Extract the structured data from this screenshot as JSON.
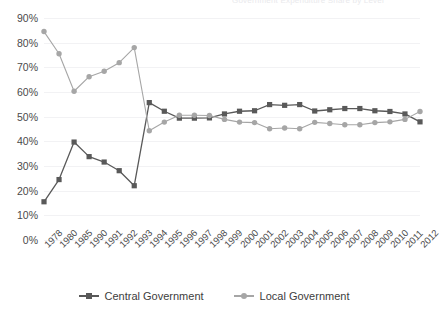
{
  "cropped_title": {
    "text": "Government Expenditure Share by Level"
  },
  "legend": {
    "position": "bottom-center",
    "items": [
      {
        "label": "Central Government",
        "color": "#595959",
        "marker": "square"
      },
      {
        "label": "Local Government",
        "color": "#a6a6a6",
        "marker": "circle"
      }
    ]
  },
  "axis": {
    "y_ticks": [
      "0%",
      "10%",
      "20%",
      "30%",
      "40%",
      "50%",
      "60%",
      "70%",
      "80%",
      "90%"
    ]
  },
  "chart_data": {
    "type": "line",
    "title": "",
    "subtitle": "",
    "xlabel": "",
    "ylabel": "",
    "ylim": [
      0,
      90
    ],
    "ytick_step": 10,
    "grid": true,
    "legend_position": "bottom-center",
    "units": "percent",
    "categories": [
      "1978",
      "1980",
      "1985",
      "1990",
      "1991",
      "1992",
      "1993",
      "1994",
      "1995",
      "1996",
      "1997",
      "1998",
      "1999",
      "2000",
      "2001",
      "2002",
      "2003",
      "2004",
      "2005",
      "2006",
      "2007",
      "2008",
      "2009",
      "2010",
      "2011",
      "2012"
    ],
    "series": [
      {
        "name": "Central Government",
        "color": "#595959",
        "marker": "square",
        "values": [
          15.5,
          24.5,
          39.7,
          33.8,
          31.6,
          28.1,
          22.0,
          55.7,
          52.2,
          49.4,
          49.4,
          49.5,
          51.1,
          52.2,
          52.4,
          54.9,
          54.6,
          54.9,
          52.3,
          52.8,
          53.3,
          53.3,
          52.4,
          52.1,
          51.1,
          47.9
        ]
      },
      {
        "name": "Local Government",
        "color": "#a6a6a6",
        "marker": "circle",
        "values": [
          84.5,
          75.5,
          60.3,
          66.2,
          68.4,
          71.9,
          78.0,
          44.3,
          47.8,
          50.6,
          50.6,
          50.5,
          48.9,
          47.8,
          47.6,
          45.1,
          45.4,
          45.1,
          47.7,
          47.2,
          46.7,
          46.7,
          47.6,
          47.9,
          48.9,
          52.1
        ]
      }
    ]
  }
}
